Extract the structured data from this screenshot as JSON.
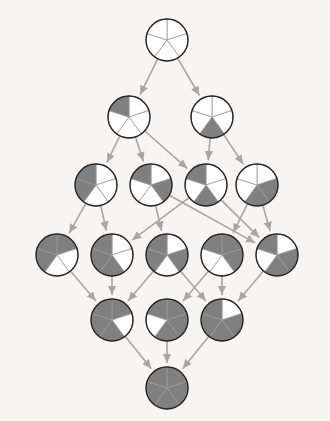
{
  "diagram": {
    "type": "lattice-graph",
    "background_color": "#f7f6f4",
    "node_radius": 21,
    "slice_count": 5,
    "slice_start_angle_deg": -90,
    "filled_color": "#7f7f7f",
    "empty_color": "#ffffff",
    "node_stroke_color": "#222222",
    "node_stroke_width": 1.4,
    "slice_divider_color": "#9a9a9a",
    "slice_divider_width": 0.8,
    "edge_color": "#a6a6a6",
    "edge_width": 1.6,
    "arrowheads": true,
    "width": 330,
    "height": 421
  },
  "levels": [
    {
      "index": 0,
      "label": "0 filled",
      "y": 40,
      "node_ids": [
        "n0"
      ]
    },
    {
      "index": 1,
      "label": "1 filled",
      "y": 117,
      "node_ids": [
        "n1",
        "n2"
      ]
    },
    {
      "index": 2,
      "label": "2 filled",
      "y": 185,
      "node_ids": [
        "n3",
        "n4",
        "n5",
        "n6"
      ]
    },
    {
      "index": 3,
      "label": "3 filled",
      "y": 255,
      "node_ids": [
        "n7",
        "n8",
        "n9",
        "n10",
        "n11"
      ]
    },
    {
      "index": 4,
      "label": "4 filled",
      "y": 320,
      "node_ids": [
        "n12",
        "n13",
        "n14"
      ]
    },
    {
      "index": 5,
      "label": "5 filled",
      "y": 388,
      "node_ids": [
        "n15"
      ]
    }
  ],
  "nodes": [
    {
      "id": "n0",
      "name": "node-empty",
      "x": 167,
      "y": 40,
      "slices": [
        0,
        0,
        0,
        0,
        0
      ],
      "filled_count": 0,
      "level": 0
    },
    {
      "id": "n1",
      "name": "node-upper-left",
      "x": 129,
      "y": 117,
      "slices": [
        0,
        0,
        0,
        0,
        1
      ],
      "filled_count": 1,
      "level": 1
    },
    {
      "id": "n2",
      "name": "node-lower-right",
      "x": 212,
      "y": 117,
      "slices": [
        0,
        0,
        1,
        0,
        0
      ],
      "filled_count": 1,
      "level": 1
    },
    {
      "id": "n3",
      "name": "node-left-half",
      "x": 96,
      "y": 185,
      "slices": [
        0,
        0,
        0,
        1,
        1
      ],
      "filled_count": 2,
      "level": 2
    },
    {
      "id": "n4",
      "name": "node-upper-pair",
      "x": 151,
      "y": 185,
      "slices": [
        0,
        1,
        0,
        0,
        1
      ],
      "filled_count": 2,
      "level": 2
    },
    {
      "id": "n5",
      "name": "node-ul-lr",
      "x": 206,
      "y": 185,
      "slices": [
        0,
        0,
        1,
        0,
        1
      ],
      "filled_count": 2,
      "level": 2
    },
    {
      "id": "n6",
      "name": "node-right-pair",
      "x": 257,
      "y": 185,
      "slices": [
        0,
        1,
        1,
        0,
        0
      ],
      "filled_count": 2,
      "level": 2
    },
    {
      "id": "n7",
      "name": "node-top-left-block",
      "x": 57,
      "y": 255,
      "slices": [
        1,
        0,
        0,
        1,
        1
      ],
      "filled_count": 3,
      "level": 3
    },
    {
      "id": "n8",
      "name": "node-left-lower-right",
      "x": 112,
      "y": 255,
      "slices": [
        0,
        0,
        1,
        1,
        1
      ],
      "filled_count": 3,
      "level": 3
    },
    {
      "id": "n9",
      "name": "node-ul-ur-ll",
      "x": 167,
      "y": 255,
      "slices": [
        0,
        1,
        0,
        1,
        1
      ],
      "filled_count": 3,
      "level": 3
    },
    {
      "id": "n10",
      "name": "node-top-band",
      "x": 222,
      "y": 255,
      "slices": [
        1,
        1,
        0,
        0,
        1
      ],
      "filled_count": 3,
      "level": 3
    },
    {
      "id": "n11",
      "name": "node-ul-ur-lr",
      "x": 277,
      "y": 255,
      "slices": [
        0,
        1,
        1,
        0,
        1
      ],
      "filled_count": 3,
      "level": 3
    },
    {
      "id": "n12",
      "name": "node-missing-upper-right",
      "x": 112,
      "y": 320,
      "slices": [
        1,
        0,
        1,
        1,
        1
      ],
      "filled_count": 4,
      "level": 4
    },
    {
      "id": "n13",
      "name": "node-missing-lower-left",
      "x": 167,
      "y": 320,
      "slices": [
        1,
        1,
        1,
        0,
        1
      ],
      "filled_count": 4,
      "level": 4
    },
    {
      "id": "n14",
      "name": "node-missing-top",
      "x": 222,
      "y": 320,
      "slices": [
        0,
        1,
        1,
        1,
        1
      ],
      "filled_count": 4,
      "level": 4
    },
    {
      "id": "n15",
      "name": "node-full",
      "x": 167,
      "y": 388,
      "slices": [
        1,
        1,
        1,
        1,
        1
      ],
      "filled_count": 5,
      "level": 5
    }
  ],
  "edges": [
    {
      "from": "n0",
      "to": "n1"
    },
    {
      "from": "n0",
      "to": "n2"
    },
    {
      "from": "n1",
      "to": "n3"
    },
    {
      "from": "n1",
      "to": "n4"
    },
    {
      "from": "n1",
      "to": "n5"
    },
    {
      "from": "n2",
      "to": "n5"
    },
    {
      "from": "n2",
      "to": "n6"
    },
    {
      "from": "n3",
      "to": "n7"
    },
    {
      "from": "n3",
      "to": "n8"
    },
    {
      "from": "n4",
      "to": "n9"
    },
    {
      "from": "n4",
      "to": "n11"
    },
    {
      "from": "n5",
      "to": "n8"
    },
    {
      "from": "n5",
      "to": "n11"
    },
    {
      "from": "n6",
      "to": "n10"
    },
    {
      "from": "n6",
      "to": "n11"
    },
    {
      "from": "n7",
      "to": "n12"
    },
    {
      "from": "n8",
      "to": "n12"
    },
    {
      "from": "n9",
      "to": "n12"
    },
    {
      "from": "n9",
      "to": "n14"
    },
    {
      "from": "n10",
      "to": "n13"
    },
    {
      "from": "n10",
      "to": "n14"
    },
    {
      "from": "n11",
      "to": "n14"
    },
    {
      "from": "n12",
      "to": "n15"
    },
    {
      "from": "n13",
      "to": "n15"
    },
    {
      "from": "n14",
      "to": "n15"
    }
  ]
}
